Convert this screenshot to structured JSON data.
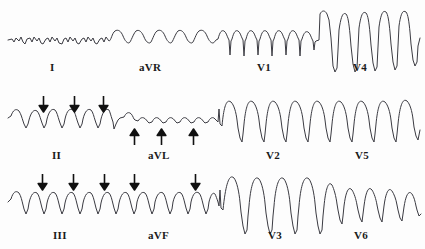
{
  "figure": {
    "kind": "12-lead-ecg-strip",
    "background_color": "#fdfdfd",
    "trace_color": "#3b3b42",
    "label_color": "#1a1a1a",
    "marker_color": "#111111",
    "rows": 3,
    "columns": 4
  },
  "rows": [
    {
      "id": "row-1",
      "labels": [
        {
          "name": "lead-label-I",
          "text": "I",
          "x": 50,
          "y": 62
        },
        {
          "name": "lead-label-aVR",
          "text": "aVR",
          "x": 139,
          "y": 62
        },
        {
          "name": "lead-label-V1",
          "text": "V1",
          "x": 257,
          "y": 62
        },
        {
          "name": "lead-label-V4",
          "text": "V4",
          "x": 353,
          "y": 62
        }
      ],
      "markers": []
    },
    {
      "id": "row-2",
      "labels": [
        {
          "name": "lead-label-II",
          "text": "II",
          "x": 52,
          "y": 66
        },
        {
          "name": "lead-label-aVL",
          "text": "aVL",
          "x": 148,
          "y": 66
        },
        {
          "name": "lead-label-V2",
          "text": "V2",
          "x": 266,
          "y": 66
        },
        {
          "name": "lead-label-V5",
          "text": "V5",
          "x": 355,
          "y": 66
        }
      ],
      "markers": [
        {
          "name": "down-arrow-marker",
          "dir": "down",
          "x": 38,
          "y": 12
        },
        {
          "name": "down-arrow-marker",
          "dir": "down",
          "x": 69,
          "y": 12
        },
        {
          "name": "down-arrow-marker",
          "dir": "down",
          "x": 98,
          "y": 12
        },
        {
          "name": "up-arrow-marker",
          "dir": "up",
          "x": 129,
          "y": 44
        },
        {
          "name": "up-arrow-marker",
          "dir": "up",
          "x": 156,
          "y": 44
        },
        {
          "name": "up-arrow-marker",
          "dir": "up",
          "x": 188,
          "y": 44
        }
      ]
    },
    {
      "id": "row-3",
      "labels": [
        {
          "name": "lead-label-III",
          "text": "III",
          "x": 53,
          "y": 64
        },
        {
          "name": "lead-label-aVF",
          "text": "aVF",
          "x": 148,
          "y": 64
        },
        {
          "name": "lead-label-V3",
          "text": "V3",
          "x": 268,
          "y": 64
        },
        {
          "name": "lead-label-V6",
          "text": "V6",
          "x": 354,
          "y": 64
        }
      ],
      "markers": [
        {
          "name": "down-arrow-marker",
          "dir": "down",
          "x": 37,
          "y": 8
        },
        {
          "name": "down-arrow-marker",
          "dir": "down",
          "x": 68,
          "y": 8
        },
        {
          "name": "down-arrow-marker",
          "dir": "down",
          "x": 99,
          "y": 8
        },
        {
          "name": "down-arrow-marker",
          "dir": "down",
          "x": 129,
          "y": 8
        },
        {
          "name": "down-arrow-marker",
          "dir": "down",
          "x": 190,
          "y": 8
        }
      ]
    }
  ],
  "chart_data": {
    "type": "line",
    "title": "",
    "xlabel": "",
    "ylabel": "",
    "grid": false,
    "legend_position": "none",
    "segments": [
      {
        "lead": "I",
        "row": 1,
        "x_start": 10,
        "x_end": 110,
        "baseline": 40,
        "amplitude": 5,
        "morphology": "low-amplitude-undulating"
      },
      {
        "lead": "aVR",
        "row": 1,
        "x_start": 110,
        "x_end": 215,
        "baseline": 40,
        "amplitude": 12,
        "morphology": "rounded-positive-bumps"
      },
      {
        "lead": "V1",
        "row": 1,
        "x_start": 215,
        "x_end": 318,
        "baseline": 38,
        "amplitude": 14,
        "morphology": "sharp-negative-spikes"
      },
      {
        "lead": "V4",
        "row": 1,
        "x_start": 318,
        "x_end": 420,
        "baseline": 42,
        "amplitude": 30,
        "morphology": "large-biphasic"
      },
      {
        "lead": "II",
        "row": 2,
        "x_start": 10,
        "x_end": 112,
        "baseline": 30,
        "amplitude": 15,
        "morphology": "rounded-notched"
      },
      {
        "lead": "aVL",
        "row": 2,
        "x_start": 112,
        "x_end": 215,
        "baseline": 28,
        "amplitude": 7,
        "morphology": "low-amplitude-bumps"
      },
      {
        "lead": "V2",
        "row": 2,
        "x_start": 215,
        "x_end": 318,
        "baseline": 34,
        "amplitude": 26,
        "morphology": "tall-peaks-deep-troughs"
      },
      {
        "lead": "V5",
        "row": 2,
        "x_start": 318,
        "x_end": 420,
        "baseline": 34,
        "amplitude": 26,
        "morphology": "tall-peaks-deep-troughs"
      },
      {
        "lead": "III",
        "row": 3,
        "x_start": 10,
        "x_end": 112,
        "baseline": 34,
        "amplitude": 14,
        "morphology": "rounded-negative"
      },
      {
        "lead": "aVF",
        "row": 3,
        "x_start": 112,
        "x_end": 215,
        "baseline": 34,
        "amplitude": 14,
        "morphology": "rounded-negative"
      },
      {
        "lead": "V3",
        "row": 3,
        "x_start": 215,
        "x_end": 318,
        "baseline": 38,
        "amplitude": 34,
        "morphology": "very-large-oscillations"
      },
      {
        "lead": "V6",
        "row": 3,
        "x_start": 318,
        "x_end": 420,
        "baseline": 34,
        "amplitude": 16,
        "morphology": "moderate-rounded"
      }
    ],
    "x": [],
    "values": []
  }
}
